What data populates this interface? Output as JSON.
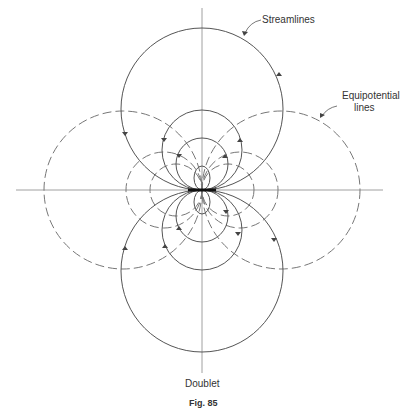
{
  "figure": {
    "labels": {
      "streamlines": "Streamlines",
      "equipotential_line1": "Equipotential",
      "equipotential_line2": "lines",
      "doublet": "Doublet"
    },
    "caption": "Fig. 85"
  },
  "geometry": {
    "origin": [
      202,
      190
    ],
    "streamline_circles": [
      {
        "cx": 202,
        "cy": 109,
        "r": 81
      },
      {
        "cx": 202,
        "cy": 150,
        "r": 40
      },
      {
        "cx": 202,
        "cy": 164,
        "r": 26
      },
      {
        "cx": 202,
        "cy": 271,
        "r": 81
      },
      {
        "cx": 202,
        "cy": 230,
        "r": 40
      },
      {
        "cx": 202,
        "cy": 216,
        "r": 26
      }
    ],
    "equipotential_circles": [
      {
        "cx": 123,
        "cy": 190,
        "r": 79
      },
      {
        "cx": 164,
        "cy": 190,
        "r": 38
      },
      {
        "cx": 176,
        "cy": 190,
        "r": 26
      },
      {
        "cx": 281,
        "cy": 190,
        "r": 79
      },
      {
        "cx": 240,
        "cy": 190,
        "r": 38
      },
      {
        "cx": 228,
        "cy": 190,
        "r": 26
      }
    ]
  }
}
